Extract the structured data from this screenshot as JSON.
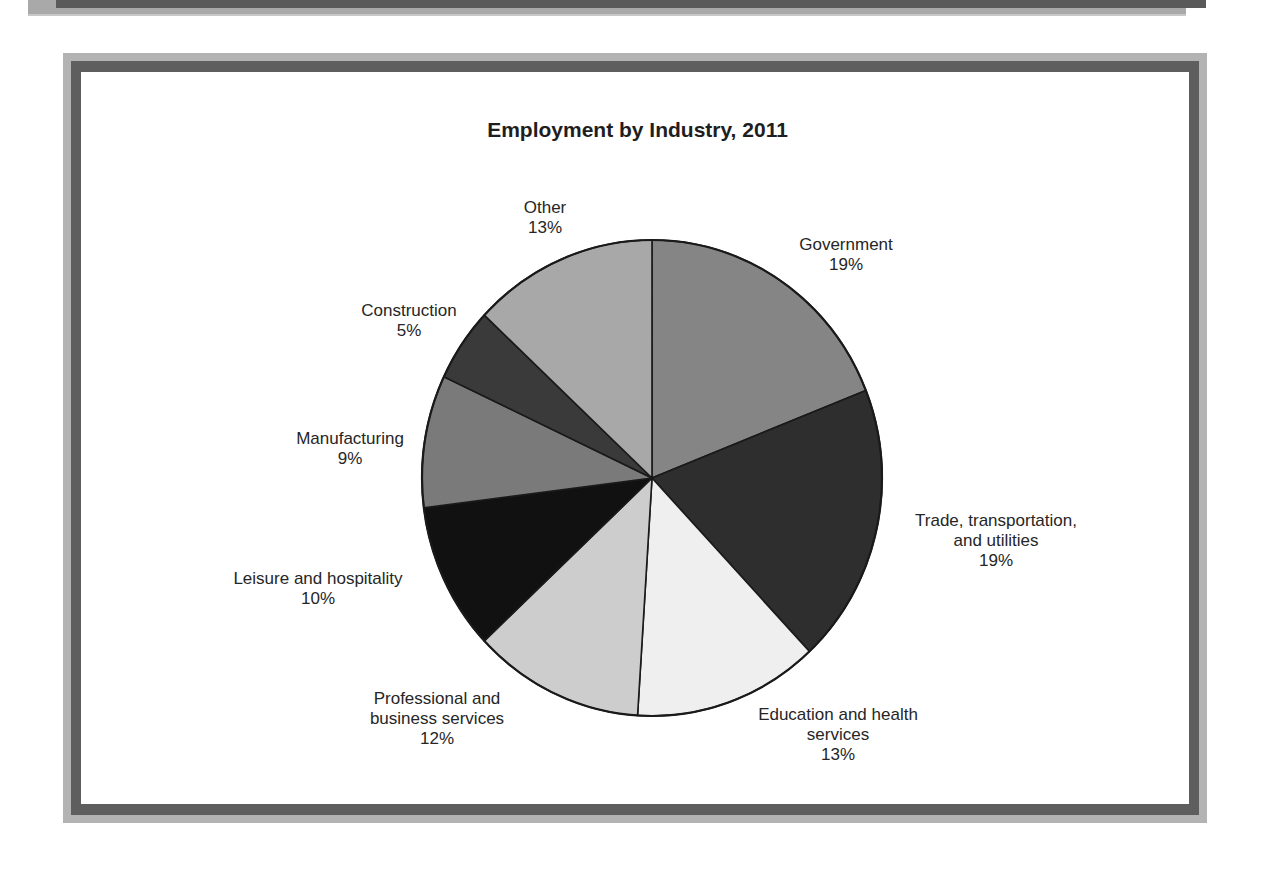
{
  "chart_data": {
    "type": "pie",
    "title": "Employment by Industry, 2011",
    "start_angle_deg": 0,
    "direction": "clockwise",
    "legend": "none (labels placed beside slices)",
    "slices": [
      {
        "label": "Government",
        "label_lines": [
          "Government"
        ],
        "value": 19,
        "display": "19%",
        "color": "#858585",
        "label_pos": {
          "x": 846,
          "y": 235
        }
      },
      {
        "label": "Trade, transportation, and utilities",
        "label_lines": [
          "Trade, transportation,",
          "and utilities"
        ],
        "value": 19,
        "display": "19%",
        "color": "#2e2e2e",
        "label_pos": {
          "x": 996,
          "y": 511
        }
      },
      {
        "label": "Education and health services",
        "label_lines": [
          "Education and health",
          "services"
        ],
        "value": 13,
        "display": "13%",
        "color": "#efefef",
        "label_pos": {
          "x": 838,
          "y": 705
        }
      },
      {
        "label": "Professional and business services",
        "label_lines": [
          "Professional and",
          "business services"
        ],
        "value": 12,
        "display": "12%",
        "color": "#cdcdcd",
        "label_pos": {
          "x": 437,
          "y": 689
        }
      },
      {
        "label": "Leisure and hospitality",
        "label_lines": [
          "Leisure and hospitality"
        ],
        "value": 10,
        "display": "10%",
        "color": "#111111",
        "label_pos": {
          "x": 318,
          "y": 569
        }
      },
      {
        "label": "Manufacturing",
        "label_lines": [
          "Manufacturing"
        ],
        "value": 9,
        "display": "9%",
        "color": "#7a7a7a",
        "label_pos": {
          "x": 350,
          "y": 429
        }
      },
      {
        "label": "Construction",
        "label_lines": [
          "Construction"
        ],
        "value": 5,
        "display": "5%",
        "color": "#3a3a3a",
        "label_pos": {
          "x": 409,
          "y": 301
        }
      },
      {
        "label": "Other",
        "label_lines": [
          "Other"
        ],
        "value": 13,
        "display": "13%",
        "color": "#a8a8a8",
        "label_pos": {
          "x": 545,
          "y": 198
        }
      }
    ]
  },
  "pie_geometry": {
    "cx": 652,
    "cy": 478,
    "rx": 230,
    "ry": 238,
    "stroke": "#1a1a1a"
  }
}
